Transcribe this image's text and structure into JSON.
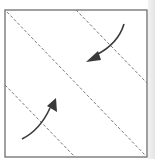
{
  "diagram": {
    "type": "origami-fold-step",
    "colors": {
      "paper_edge": "#6e6e6e",
      "fold_line": "#7a7a7a",
      "arrow": "#3a3a3a",
      "background_shade": "#e8e8e8"
    },
    "square": {
      "x": 5,
      "y": 10,
      "width": 142,
      "height": 147
    },
    "fold_lines": [
      {
        "name": "main-diagonal",
        "x1": 7,
        "y1": 12,
        "x2": 146,
        "y2": 156
      },
      {
        "name": "top-right-corner-fold",
        "x1": 76,
        "y1": 10,
        "x2": 147,
        "y2": 83
      },
      {
        "name": "bottom-left-corner-fold",
        "x1": 5,
        "y1": 85,
        "x2": 75,
        "y2": 157
      }
    ],
    "arrows": [
      {
        "name": "fold-top-right-corner-arrow",
        "direction": "down-left"
      },
      {
        "name": "fold-bottom-left-corner-arrow",
        "direction": "up-right"
      }
    ]
  }
}
